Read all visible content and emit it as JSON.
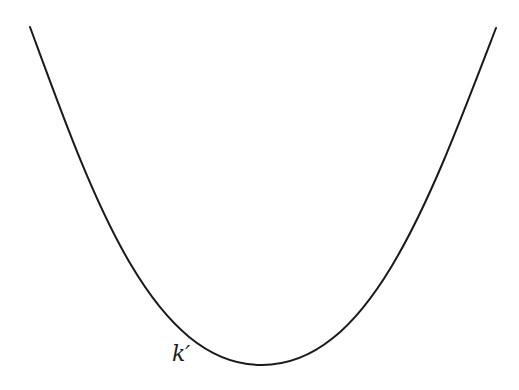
{
  "diagram": {
    "curve": {
      "shape": "parabola",
      "stroke_color": "#1a1a1a",
      "stroke_width": 2,
      "left_end": [
        30,
        27
      ],
      "minimum": [
        262,
        365
      ],
      "right_end": [
        496,
        28
      ]
    },
    "label": {
      "text": "k′",
      "x": 172,
      "y": 358
    }
  }
}
